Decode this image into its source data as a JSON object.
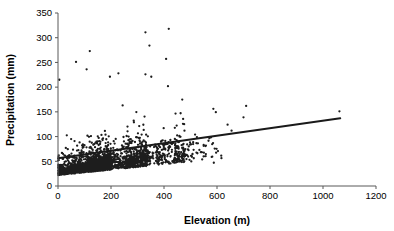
{
  "chart_data": {
    "type": "scatter",
    "title": "",
    "xlabel": "Elevation (m)",
    "ylabel": "Precipitation (mm)",
    "xlim": [
      0,
      1200
    ],
    "ylim": [
      0,
      350
    ],
    "xticks": [
      0,
      200,
      400,
      600,
      800,
      1000,
      1200
    ],
    "yticks": [
      0,
      50,
      100,
      150,
      200,
      250,
      300,
      350
    ],
    "xtick_labels": [
      "0",
      "200",
      "400",
      "600",
      "800",
      "1000",
      "1200"
    ],
    "ytick_labels": [
      "0",
      "50",
      "100",
      "150",
      "200",
      "250",
      "300",
      "350"
    ],
    "grid": false,
    "legend": false,
    "marker_color": "#1d1d1d",
    "marker_size_px": 1.6,
    "axis_color": "#585858",
    "series": [
      {
        "name": "Weather stations",
        "type": "scatter",
        "n_points": 2100,
        "description": "Dense cloud of station observations, heavily concentrated at low elevation (0-200 m) and low precipitation (0-60 mm), thinning out rapidly above 450 m elevation; a few high-precipitation outliers reach 310-320 mm near 300-420 m.",
        "notable_points": [
          {
            "x": 330,
            "y": 311
          },
          {
            "x": 418,
            "y": 318
          },
          {
            "x": 345,
            "y": 284
          },
          {
            "x": 120,
            "y": 273
          },
          {
            "x": 408,
            "y": 257
          },
          {
            "x": 68,
            "y": 251
          },
          {
            "x": 108,
            "y": 236
          },
          {
            "x": 228,
            "y": 228
          },
          {
            "x": 330,
            "y": 226
          },
          {
            "x": 352,
            "y": 221
          },
          {
            "x": 5,
            "y": 215
          },
          {
            "x": 196,
            "y": 221
          },
          {
            "x": 415,
            "y": 202
          },
          {
            "x": 710,
            "y": 162
          },
          {
            "x": 1062,
            "y": 151
          },
          {
            "x": 700,
            "y": 139
          },
          {
            "x": 640,
            "y": 124
          },
          {
            "x": 655,
            "y": 112
          },
          {
            "x": 588,
            "y": 47
          }
        ]
      },
      {
        "name": "Linear trend",
        "type": "line",
        "x": [
          0,
          1065
        ],
        "y": [
          56,
          137
        ],
        "slope_mm_per_m": 0.076,
        "intercept_mm": 56
      }
    ]
  },
  "axes": {
    "x_title": "Elevation (m)",
    "y_title": "Precipitation (mm)"
  }
}
